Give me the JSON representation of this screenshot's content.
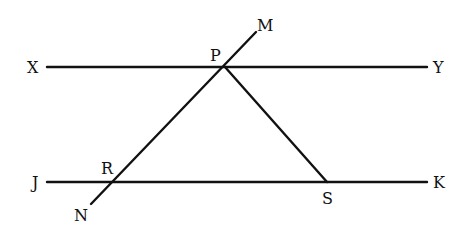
{
  "diagram": {
    "labels": {
      "X": "X",
      "Y": "Y",
      "P": "P",
      "M": "M",
      "J": "J",
      "K": "K",
      "R": "R",
      "S": "S",
      "N": "N"
    },
    "lines": [
      {
        "name": "XY",
        "from": "X",
        "to": "Y"
      },
      {
        "name": "JK",
        "from": "J",
        "to": "K"
      },
      {
        "name": "MN",
        "from": "M",
        "to": "N",
        "through": [
          "P",
          "R"
        ]
      },
      {
        "name": "PS",
        "from": "P",
        "to": "S"
      }
    ],
    "colors": {
      "stroke": "#111111",
      "background": "#ffffff"
    }
  }
}
